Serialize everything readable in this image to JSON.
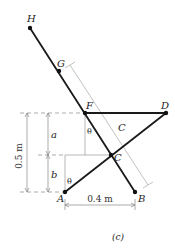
{
  "figure": {
    "caption": "(c)",
    "points": {
      "H": {
        "label": "H",
        "x": 30,
        "y": 28
      },
      "G": {
        "label": "G",
        "x": 59,
        "y": 71
      },
      "F": {
        "label": "F",
        "x": 85,
        "y": 113
      },
      "D": {
        "label": "D",
        "x": 166,
        "y": 113
      },
      "C": {
        "label": "C",
        "x": 111,
        "y": 155
      },
      "A": {
        "label": "A",
        "x": 65,
        "y": 192
      },
      "B": {
        "label": "B",
        "x": 135,
        "y": 192
      }
    },
    "members": [
      {
        "name": "HB",
        "from": "H",
        "to": "B"
      },
      {
        "name": "FD",
        "from": "F",
        "to": "D"
      },
      {
        "name": "AD",
        "from": "A",
        "to": "D"
      }
    ],
    "dimensions": {
      "height_total": "0.5 m",
      "height_upper": "a",
      "height_lower": "b",
      "base_width": "0.4 m",
      "slant_label": "C"
    },
    "angles": {
      "theta_at_F": "θ",
      "theta_at_A": "θ"
    },
    "colors": {
      "member": "#1a1a1a",
      "dimension": "#888888",
      "background": "#ffffff"
    }
  }
}
